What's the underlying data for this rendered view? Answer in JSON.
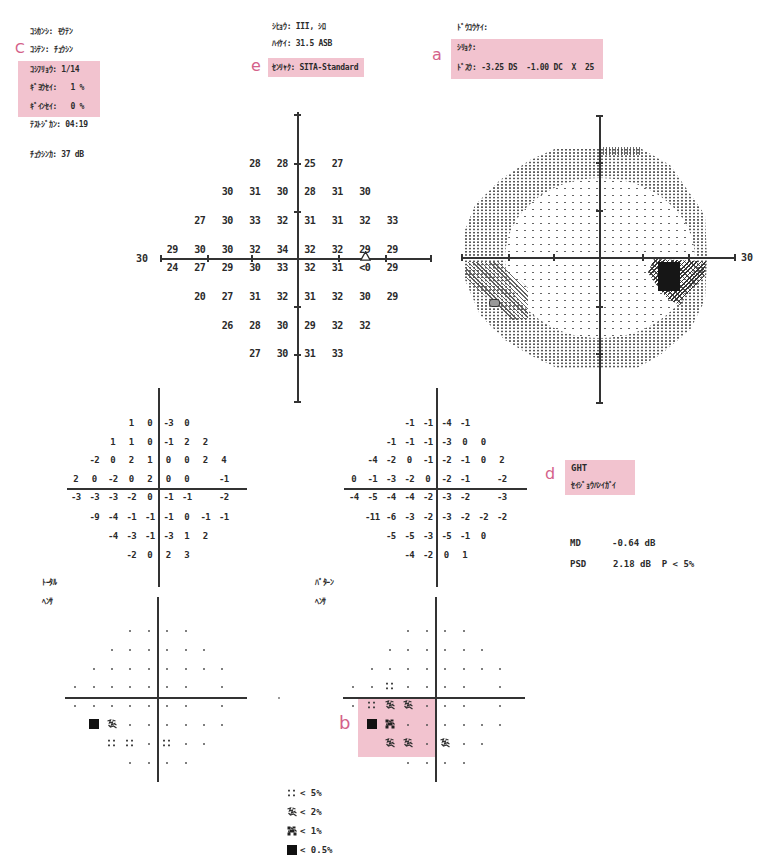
{
  "header": {
    "left": {
      "fixation_monitor": "ｺｼｶﾝｼ: ﾓｳﾃﾝ",
      "fixation_target": "ｺｼﾃﾝ: ﾁｭｳｼﾝ",
      "fixation_losses": "ｺｼﾌﾘｮｳ: 1/14",
      "false_pos": "ｷﾞﾖｳｾｲ:   1 %",
      "false_neg": "ｷﾞｲﾝｾｲ:   0 %",
      "test_duration": "ﾃｽﾄｼﾞｶﾝ: 04:19",
      "fovea": "ﾁｭｳｼﾝｶ: 37 dB"
    },
    "middle": {
      "stimulus": "ｼﾋｮｳ: III, ｼﾛ",
      "background": "ﾊｲｹｲ: 31.5 ASB",
      "strategy": "ｾﾝﾘｬｸ: SITA-Standard"
    },
    "right": {
      "pupil": "ﾄﾞｳｺｳｹｲ:",
      "visual_acuity": "ｼﾘｮｸ:",
      "rx": "ﾄﾞｽｳ: -3.25 DS  -1.00 DC  X  25"
    }
  },
  "annotations": {
    "a": "a",
    "b": "b",
    "c": "C",
    "d": "d",
    "e": "e"
  },
  "threshold_plot": {
    "axis_label_left": "30",
    "rows": [
      [
        "28",
        "28",
        "25",
        "27"
      ],
      [
        "30",
        "31",
        "30",
        "28",
        "31",
        "30"
      ],
      [
        "27",
        "30",
        "33",
        "32",
        "31",
        "31",
        "32",
        "33"
      ],
      [
        "29",
        "30",
        "30",
        "32",
        "34",
        "32",
        "32",
        "29",
        "29"
      ],
      [
        "24",
        "27",
        "29",
        "30",
        "33",
        "32",
        "31",
        "<0",
        "29"
      ],
      [
        "20",
        "27",
        "31",
        "32",
        "31",
        "32",
        "30",
        "29"
      ],
      [
        "26",
        "28",
        "30",
        "29",
        "32",
        "32"
      ],
      [
        "27",
        "30",
        "31",
        "33"
      ]
    ],
    "blind_spot_marker": "triangle-icon"
  },
  "greyscale_plot": {
    "axis_label_right": "30"
  },
  "total_deviation": {
    "rows": [
      [
        "1",
        "0",
        "-3",
        "0"
      ],
      [
        "1",
        "1",
        "0",
        "-1",
        "2",
        "2"
      ],
      [
        "-2",
        "0",
        "2",
        "1",
        "0",
        "0",
        "2",
        "4"
      ],
      [
        "2",
        "0",
        "-2",
        "0",
        "2",
        "0",
        "0",
        null,
        "-1"
      ],
      [
        "-3",
        "-3",
        "-3",
        "-2",
        "0",
        "-1",
        "-1",
        null,
        "-2"
      ],
      [
        "-9",
        "-4",
        "-1",
        "-1",
        "-1",
        "0",
        "-1",
        "-1"
      ],
      [
        "-4",
        "-3",
        "-1",
        "-3",
        "1",
        "2"
      ],
      [
        "-2",
        "0",
        "2",
        "3"
      ]
    ]
  },
  "pattern_deviation": {
    "rows": [
      [
        "-1",
        "-1",
        "-4",
        "-1"
      ],
      [
        "-1",
        "-1",
        "-1",
        "-3",
        "0",
        "0"
      ],
      [
        "-4",
        "-2",
        "0",
        "-1",
        "-2",
        "-1",
        "0",
        "2"
      ],
      [
        "0",
        "-1",
        "-3",
        "-2",
        "0",
        "-2",
        "-1",
        null,
        "-2"
      ],
      [
        "-4",
        "-5",
        "-4",
        "-4",
        "-2",
        "-3",
        "-2",
        null,
        "-3"
      ],
      [
        "-11",
        "-6",
        "-3",
        "-2",
        "-3",
        "-2",
        "-2",
        "-2"
      ],
      [
        "-5",
        "-5",
        "-3",
        "-5",
        "-1",
        "0"
      ],
      [
        "-4",
        "-2",
        "0",
        "1"
      ]
    ]
  },
  "total_deviation_prob": {
    "label_line1": "ﾄｰﾀﾙ",
    "label_line2": "ﾍﾝｻ",
    "rows": [
      [
        "n",
        "n",
        "n",
        "n"
      ],
      [
        "n",
        "n",
        "n",
        "n",
        "n",
        "n"
      ],
      [
        "n",
        "n",
        "n",
        "n",
        "n",
        "n",
        "n",
        "n"
      ],
      [
        "n",
        "n",
        "n",
        "n",
        "n",
        "n",
        "n",
        null,
        "n"
      ],
      [
        "n",
        "n",
        "n",
        "n",
        "n",
        "n",
        "n",
        null,
        "n"
      ],
      [
        "p05",
        "p2",
        "n",
        "n",
        "n",
        "n",
        "n",
        "n"
      ],
      [
        "p5",
        "p5",
        "n",
        "p5",
        "n",
        "n"
      ],
      [
        "n",
        "n",
        "n",
        "n"
      ]
    ]
  },
  "pattern_deviation_prob": {
    "label_line1": "ﾊﾟﾀｰﾝ",
    "label_line2": "ﾍﾝｻ",
    "rows": [
      [
        "n",
        "n",
        "n",
        "n"
      ],
      [
        "n",
        "n",
        "n",
        "n",
        "n",
        "n"
      ],
      [
        "n",
        "n",
        "n",
        "n",
        "n",
        "n",
        "n",
        "n"
      ],
      [
        "n",
        "n",
        "p5",
        "n",
        "n",
        "n",
        "n",
        null,
        "n"
      ],
      [
        "n",
        "p5",
        "p2",
        "p2",
        "n",
        "n",
        "n",
        null,
        "n"
      ],
      [
        "p05",
        "p1",
        "n",
        "n",
        "n",
        "n",
        "n",
        "n"
      ],
      [
        "p2",
        "p2",
        "n",
        "p2",
        "n",
        "n"
      ],
      [
        "n",
        "n",
        "n",
        "n"
      ]
    ]
  },
  "ght": {
    "label": "GHT",
    "result": "ｾｲｼﾞｮｳﾊﾝｲｶﾞｲ"
  },
  "indices": {
    "md_label": "MD",
    "md_value": "-0.64 dB",
    "psd_label": "PSD",
    "psd_value": "2.18 dB  P < 5%"
  },
  "legend": [
    {
      "symbol": "p5",
      "label": "< 5%"
    },
    {
      "symbol": "p2",
      "label": "< 2%"
    },
    {
      "symbol": "p1",
      "label": "< 1%"
    },
    {
      "symbol": "p05",
      "label": "< 0.5%"
    }
  ],
  "colors": {
    "highlight": "#f2c3cf",
    "annotation": "#d4628a",
    "ink": "#2b2b2b"
  }
}
